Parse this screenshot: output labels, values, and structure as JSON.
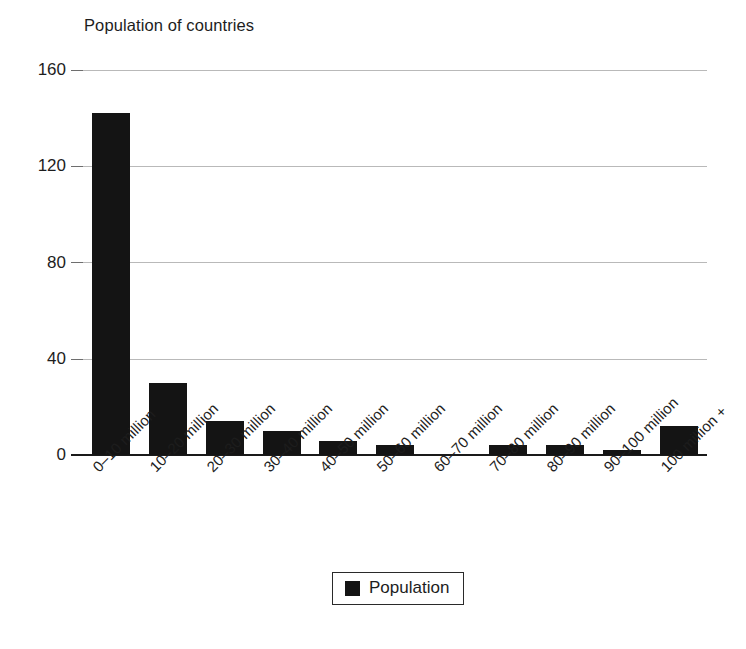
{
  "chart_data": {
    "type": "bar",
    "title": "Population of countries",
    "xlabel": "",
    "ylabel": "",
    "ylim": [
      0,
      160
    ],
    "yticks": [
      0,
      40,
      80,
      120,
      160
    ],
    "grid": true,
    "legend_position": "bottom",
    "legend": [
      "Population"
    ],
    "bar_color": "#141414",
    "categories": [
      "0–10 million",
      "10–20 million",
      "20–30 million",
      "30–40 million",
      "40–50 million",
      "50–60 million",
      "60–70 million",
      "70–80 million",
      "80–90 million",
      "90–100 million",
      "100 million +"
    ],
    "series": [
      {
        "name": "Population",
        "values": [
          142,
          30,
          14,
          10,
          6,
          4,
          0,
          4,
          4,
          2,
          12
        ]
      }
    ]
  },
  "axis": {
    "y_tick_labels": [
      "160",
      "120",
      "80",
      "40",
      "0"
    ]
  },
  "legend": {
    "swatch_name": "population-swatch",
    "label": "Population"
  }
}
